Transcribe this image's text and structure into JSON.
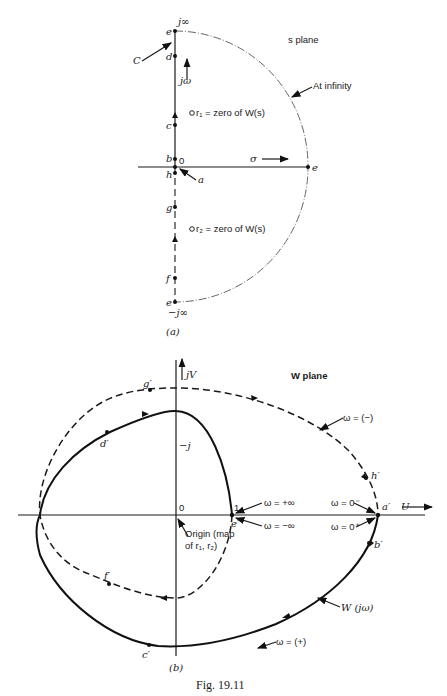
{
  "figure": {
    "caption": "Fig. 19.11",
    "panel_a": {
      "label": "(a)",
      "plane_title": "s plane",
      "axis_vertical": "jω",
      "axis_horizontal": "σ",
      "top_label": "j∞",
      "bottom_label": "−j∞",
      "origin": "0",
      "arc_label": "At infinity",
      "contour_label": "C",
      "points": [
        "e",
        "d",
        "c",
        "b",
        "h",
        "a",
        "g",
        "f",
        "e",
        "e"
      ],
      "zero1": "r₁ = zero of W(s)",
      "zero2": "r₂ = zero of W(s)",
      "pt_e_top": "e",
      "pt_d": "d",
      "pt_c": "c",
      "pt_b": "b",
      "pt_h": "h",
      "pt_a": "a",
      "pt_g": "g",
      "pt_f": "f",
      "pt_e_bottom": "e",
      "pt_e_right": "e"
    },
    "panel_b": {
      "label": "(b)",
      "plane_title": "W plane",
      "axis_vertical": "jV",
      "axis_horizontal": "U",
      "origin": "0",
      "minus_j": "−j",
      "one": "1",
      "origin_note_line1": "Origin (map",
      "origin_note_line2": "of r₁, r₂)",
      "w_plus_inf": "ω = +∞",
      "w_minus_inf": "ω = −∞",
      "w_zero_minus": "ω = 0⁻",
      "w_zero_plus": "ω = 0⁺",
      "w_negative": "ω = (−)",
      "w_positive": "ω = (+)",
      "curve_label": "W (jω)",
      "pt_a": "a′",
      "pt_b": "b′",
      "pt_c": "c′",
      "pt_d": "d′",
      "pt_e": "e′",
      "pt_f": "f′",
      "pt_g": "g′",
      "pt_h": "h′"
    }
  }
}
